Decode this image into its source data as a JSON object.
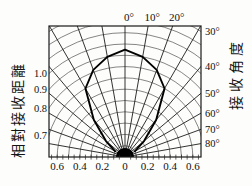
{
  "figure": {
    "left_axis_title": "相對接收距離",
    "right_axis_title": "接收角度",
    "top_angle_labels": [
      "0°",
      "10°",
      "20°"
    ],
    "right_angle_labels": [
      "30°",
      "40°",
      "50°",
      "60°",
      "70°",
      "80°"
    ],
    "radial_labels_left": [
      "1.0",
      "0.9",
      "0.8",
      "0.7"
    ],
    "bottom_labels": [
      "0.6",
      "0.4",
      "0.2",
      "0",
      "0.2",
      "0.4",
      "0.6"
    ],
    "line_color": "#000000",
    "grid_color": "#444444",
    "radial_line_color": "#1c1c1c",
    "background_color": "#fdfdfb"
  },
  "chart_data": {
    "type": "line",
    "subtype": "polar-pattern",
    "title": "",
    "xlabel": "接收角度",
    "ylabel": "相對接收距離",
    "angle_unit": "degrees from vertical (0° = straight up)",
    "angle_gridlines_deg": [
      -80,
      -70,
      -60,
      -50,
      -40,
      -30,
      -20,
      -10,
      0,
      10,
      20,
      30,
      40,
      50,
      60,
      70,
      80
    ],
    "radial_gridlines": [
      0.1,
      0.2,
      0.3,
      0.4,
      0.5,
      0.6,
      0.7,
      0.8,
      0.9,
      1.0,
      1.1,
      1.2,
      1.3
    ],
    "radial_tick_step": 0.05,
    "radial_tick_max": 0.65,
    "radial_label_values": [
      1.0,
      0.9,
      0.8,
      0.7
    ],
    "top_label_values_deg": [
      0,
      10,
      20
    ],
    "right_label_values_deg": [
      30,
      40,
      50,
      60,
      70,
      80
    ],
    "bottom_tick_values": [
      -0.6,
      -0.4,
      -0.2,
      0,
      0.2,
      0.4,
      0.6
    ],
    "origin_marker_r": 0.08,
    "grid": true,
    "legend": false,
    "series": [
      {
        "name": "relative-reception-distance-pattern",
        "angles_deg": [
          -60,
          -50,
          -40,
          -30,
          -20,
          -10,
          0,
          10,
          20,
          30,
          40,
          50,
          60
        ],
        "r": [
          0.1,
          0.22,
          0.43,
          0.7,
          0.82,
          0.9,
          0.95,
          0.9,
          0.82,
          0.7,
          0.43,
          0.22,
          0.1
        ]
      }
    ]
  }
}
